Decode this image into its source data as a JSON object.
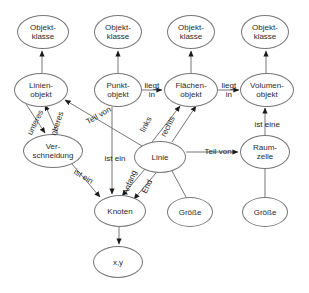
{
  "diagram": {
    "stroke_color": "#777777",
    "text_color": "#2b2b2b",
    "background": "#ffffff",
    "nodes": [
      {
        "id": "ok1",
        "label": "Objekt-\nklasse",
        "cx": 43,
        "cy": 32,
        "rx": 26,
        "ry": 17
      },
      {
        "id": "ok2",
        "label": "Objekt-\nklasse",
        "cx": 118,
        "cy": 32,
        "rx": 24,
        "ry": 17
      },
      {
        "id": "ok3",
        "label": "Objekt-\nklasse",
        "cx": 191,
        "cy": 32,
        "rx": 24,
        "ry": 17
      },
      {
        "id": "ok4",
        "label": "Objekt-\nklasse",
        "cx": 265,
        "cy": 32,
        "rx": 24,
        "ry": 17
      },
      {
        "id": "linienobjekt",
        "label": "Linien-\nobjekt",
        "cx": 41,
        "cy": 90,
        "rx": 27,
        "ry": 17
      },
      {
        "id": "punktobjekt",
        "label": "Punkt-\nobjekt",
        "cx": 118,
        "cy": 90,
        "rx": 24,
        "ry": 17
      },
      {
        "id": "flaechenobjekt",
        "label": "Flächen-\nobjekt",
        "cx": 191,
        "cy": 90,
        "rx": 27,
        "ry": 17
      },
      {
        "id": "volumenobjekt",
        "label": "Volumen-\nobjekt",
        "cx": 267,
        "cy": 90,
        "rx": 27,
        "ry": 17
      },
      {
        "id": "verschneidung",
        "label": "Ver-\nschneidung",
        "cx": 53,
        "cy": 151,
        "rx": 30,
        "ry": 17
      },
      {
        "id": "linie",
        "label": "Linie",
        "cx": 160,
        "cy": 157,
        "rx": 26,
        "ry": 16
      },
      {
        "id": "raumzelle",
        "label": "Raum-\nzelle",
        "cx": 265,
        "cy": 152,
        "rx": 25,
        "ry": 17
      },
      {
        "id": "knoten",
        "label": "Knoten",
        "cx": 120,
        "cy": 211,
        "rx": 26,
        "ry": 16
      },
      {
        "id": "groesse1",
        "label": "Größe",
        "cx": 190,
        "cy": 212,
        "rx": 23,
        "ry": 15
      },
      {
        "id": "groesse2",
        "label": "Größe",
        "cx": 265,
        "cy": 212,
        "rx": 23,
        "ry": 15
      },
      {
        "id": "xy",
        "label": "x,y",
        "cx": 118,
        "cy": 262,
        "rx": 25,
        "ry": 16
      }
    ],
    "edge_labels": [
      {
        "id": "unteres",
        "text": "unteres",
        "x": 35,
        "y": 122,
        "rotate": -64
      },
      {
        "id": "oberes",
        "text": "oberes",
        "x": 57,
        "y": 123,
        "rotate": -72
      },
      {
        "id": "teil-von-linie",
        "text": "Teil von",
        "x": 98,
        "y": 115,
        "rotate": -30
      },
      {
        "id": "liegt-in-1",
        "text": "liegt\nin",
        "x": 152,
        "y": 90,
        "rotate": 0
      },
      {
        "id": "liegt-in-2",
        "text": "liegt\nin",
        "x": 229,
        "y": 90,
        "rotate": 0
      },
      {
        "id": "links",
        "text": "links",
        "x": 146,
        "y": 124,
        "rotate": -63
      },
      {
        "id": "rechts",
        "text": "rechts",
        "x": 168,
        "y": 126,
        "rotate": -63
      },
      {
        "id": "ist-eine",
        "text": "ist   eine",
        "x": 267,
        "y": 124,
        "rotate": 0
      },
      {
        "id": "ist-ein-punkt",
        "text": "ist   ein",
        "x": 115,
        "y": 158,
        "rotate": 0
      },
      {
        "id": "ist-ein-verschneidung",
        "text": "ist  ein",
        "x": 83,
        "y": 176,
        "rotate": 32
      },
      {
        "id": "anfang",
        "text": "Anfang",
        "x": 129,
        "y": 182,
        "rotate": -68
      },
      {
        "id": "end",
        "text": "End",
        "x": 147,
        "y": 186,
        "rotate": -64
      },
      {
        "id": "teil-von-raumzelle",
        "text": "Teil von",
        "x": 218,
        "y": 151,
        "rotate": 0
      }
    ],
    "edges": [
      {
        "id": "linienobjekt-ok1",
        "from": "linienobjekt",
        "to": "ok1",
        "arrow": "end"
      },
      {
        "id": "punktobjekt-ok2",
        "from": "punktobjekt",
        "to": "ok2",
        "arrow": "end"
      },
      {
        "id": "flaechenobjekt-ok3",
        "from": "flaechenobjekt",
        "to": "ok3",
        "arrow": "end"
      },
      {
        "id": "volumenobjekt-ok4",
        "from": "volumenobjekt",
        "to": "ok4",
        "arrow": "end"
      },
      {
        "id": "punktobjekt-flaechenobjekt",
        "from": "punktobjekt",
        "to": "flaechenobjekt",
        "arrow": "end"
      },
      {
        "id": "flaechenobjekt-volumenobjekt",
        "from": "flaechenobjekt",
        "to": "volumenobjekt",
        "arrow": "end"
      },
      {
        "id": "linienobjekt-verschneidung-unteres",
        "from": "linienobjekt",
        "to": "verschneidung",
        "arrow": "end"
      },
      {
        "id": "verschneidung-linienobjekt-oberes",
        "from": "verschneidung",
        "to": "linienobjekt",
        "arrow": "end"
      },
      {
        "id": "linie-linienobjekt-teilvon",
        "from": "linie",
        "to": "linienobjekt",
        "arrow": "end"
      },
      {
        "id": "linie-flaechenobjekt-links",
        "from": "linie",
        "to": "flaechenobjekt",
        "arrow": "end"
      },
      {
        "id": "linie-flaechenobjekt-rechts",
        "from": "linie",
        "to": "flaechenobjekt",
        "arrow": "end"
      },
      {
        "id": "raumzelle-volumenobjekt-isteine",
        "from": "raumzelle",
        "to": "volumenobjekt",
        "arrow": "end"
      },
      {
        "id": "linie-raumzelle-teilvon",
        "from": "linie",
        "to": "raumzelle",
        "arrow": "end"
      },
      {
        "id": "punktobjekt-knoten-istein",
        "from": "punktobjekt",
        "to": "knoten",
        "arrow": "end"
      },
      {
        "id": "verschneidung-knoten-istein",
        "from": "verschneidung",
        "to": "knoten",
        "arrow": "end"
      },
      {
        "id": "linie-knoten-anfang",
        "from": "linie",
        "to": "knoten",
        "arrow": "end"
      },
      {
        "id": "linie-knoten-end",
        "from": "linie",
        "to": "knoten",
        "arrow": "end"
      },
      {
        "id": "knoten-xy",
        "from": "knoten",
        "to": "xy",
        "arrow": "end"
      },
      {
        "id": "linie-groesse1",
        "from": "linie",
        "to": "groesse1",
        "arrow": "none"
      },
      {
        "id": "raumzelle-groesse2",
        "from": "raumzelle",
        "to": "groesse2",
        "arrow": "none"
      }
    ]
  }
}
